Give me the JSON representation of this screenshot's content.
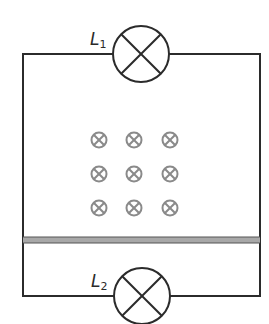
{
  "diagram": {
    "type": "circuit",
    "colors": {
      "wire": "#2b2b2b",
      "field_symbol": "#8a8a8a",
      "rod_fill": "#a8a8a8",
      "rod_edge": "#555555"
    },
    "lamps": [
      {
        "id": "L1",
        "label_main": "L",
        "label_sub": "1",
        "position": "top"
      },
      {
        "id": "L2",
        "label_main": "L",
        "label_sub": "2",
        "position": "bottom"
      }
    ],
    "magnetic_field": {
      "direction": "into-page",
      "symbol": "⊗",
      "rows": 3,
      "cols": 3
    },
    "rod": {
      "label": "",
      "orientation": "horizontal"
    }
  }
}
